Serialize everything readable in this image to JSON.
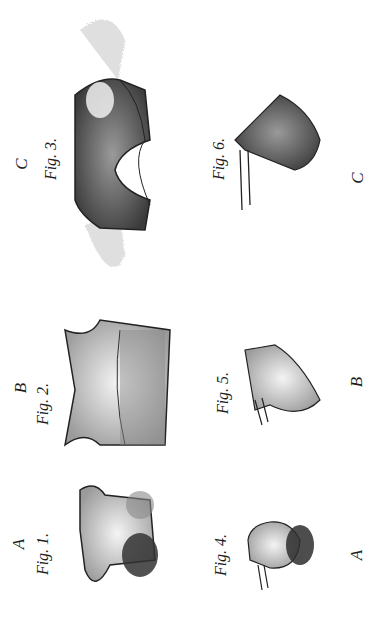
{
  "plate": {
    "figures": [
      {
        "id": "fig1",
        "label": "Fig. 1.",
        "group": "A"
      },
      {
        "id": "fig2",
        "label": "Fig. 2.",
        "group": "B"
      },
      {
        "id": "fig3",
        "label": "Fig. 3.",
        "group": "C"
      },
      {
        "id": "fig4",
        "label": "Fig. 4.",
        "group": "A"
      },
      {
        "id": "fig5",
        "label": "Fig. 5.",
        "group": "B"
      },
      {
        "id": "fig6",
        "label": "Fig. 6.",
        "group": "C"
      }
    ],
    "letters": {
      "top_a": "A",
      "top_b": "B",
      "top_c": "C",
      "bottom_a": "A",
      "bottom_b": "B",
      "bottom_c": "C"
    },
    "colors": {
      "ink": "#1e1e1e",
      "paper": "#ffffff",
      "shade": "#6a6a6a",
      "light": "#c8c8c8"
    }
  }
}
